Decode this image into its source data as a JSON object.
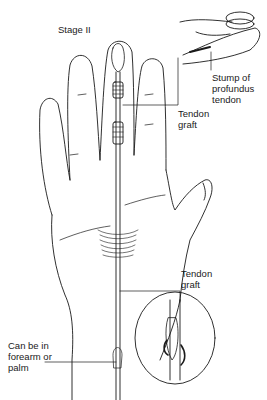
{
  "figure": {
    "stage_title": "Stage II",
    "labels": {
      "stump": "Stump of\nprofundus\ntendon",
      "graft_top": "Tendon\ngraft",
      "graft_bottom": "Tendon\ngraft",
      "forearm": "Can be in\nforearm or\npalm"
    },
    "colors": {
      "line": "#1a1a1a",
      "background": "#ffffff"
    }
  }
}
